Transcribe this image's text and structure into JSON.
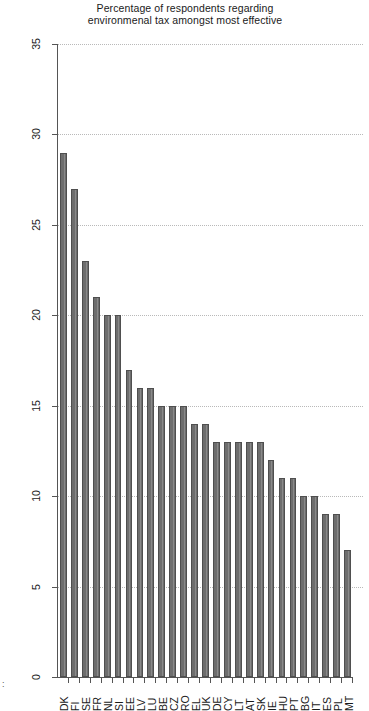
{
  "chart_data": {
    "type": "bar",
    "orientation": "vertical-rendered-rotated",
    "title": "",
    "xlabel": "",
    "ylabel": "Percentage of respondents regarding environmenal tax amongst most effective",
    "ylim": [
      0,
      35
    ],
    "yticks": [
      0,
      5,
      10,
      15,
      20,
      25,
      30,
      35
    ],
    "grid": true,
    "legend": false,
    "bar_color": "#6e6e6e",
    "bar_edge_color": "#4f4f4f",
    "categories": [
      "DK",
      "FI",
      "SE",
      "FR",
      "NL",
      "SI",
      "EE",
      "LV",
      "LU",
      "BE",
      "CZ",
      "RO",
      "EL",
      "UK",
      "DE",
      "CY",
      "LT",
      "AT",
      "SK",
      "IE",
      "HU",
      "PT",
      "BG",
      "IT",
      "ES",
      "PL",
      "MT"
    ],
    "values": [
      29,
      27,
      23,
      21,
      20,
      20,
      17,
      16,
      16,
      15,
      15,
      15,
      14,
      14,
      13,
      13,
      13,
      13,
      13,
      12,
      11,
      11,
      10,
      10,
      9,
      9,
      7
    ]
  },
  "axis": {
    "tick_labels": [
      "0",
      "5",
      "10",
      "15",
      "20",
      "25",
      "30",
      "35"
    ],
    "title_line_1": "Percentage of respondents regarding",
    "title_line_2": "environmenal tax amongst most effective"
  },
  "caption": {
    "marker": ":"
  }
}
